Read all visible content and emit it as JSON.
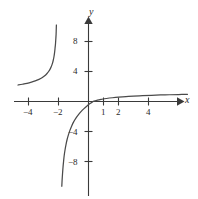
{
  "chart_data": {
    "type": "line",
    "title": "",
    "subtitle": "",
    "xlabel": "x",
    "ylabel": "y",
    "xlim": [
      -5.1,
      7.3
    ],
    "ylim": [
      -6.5,
      3.4
    ],
    "grid": false,
    "legend": null,
    "axis_color": "#3a3a3a",
    "curve_color": "#4a4a4a",
    "background": "#ffffff",
    "xticks": [
      -4,
      -2,
      1,
      2,
      4
    ],
    "xtick_labels": [
      "−4",
      "−2",
      "1",
      "2",
      "4"
    ],
    "yticks": [
      8,
      4,
      -4,
      -8
    ],
    "ytick_labels": [
      "8",
      "4",
      "−4",
      "−8"
    ],
    "series": [
      {
        "name": "upper-left-branch",
        "points": [
          [
            -4.7,
            2.2
          ],
          [
            -4.4,
            2.3
          ],
          [
            -4.1,
            2.42
          ],
          [
            -3.8,
            2.58
          ],
          [
            -3.55,
            2.74
          ],
          [
            -3.3,
            2.95
          ],
          [
            -3.1,
            3.16
          ],
          [
            -2.92,
            3.42
          ],
          [
            -2.78,
            3.7
          ],
          [
            -2.66,
            4.0
          ],
          [
            -2.56,
            4.32
          ],
          [
            -2.48,
            4.66
          ],
          [
            -2.41,
            5.05
          ],
          [
            -2.35,
            5.5
          ],
          [
            -2.3,
            6.0
          ],
          [
            -2.26,
            6.55
          ],
          [
            -2.23,
            7.1
          ],
          [
            -2.2,
            7.7
          ],
          [
            -2.18,
            8.3
          ],
          [
            -2.16,
            8.95
          ],
          [
            -2.15,
            9.6
          ],
          [
            -2.14,
            10.2
          ]
        ]
      },
      {
        "name": "lower-left-branch",
        "points": [
          [
            0.3,
            0.0
          ],
          [
            0.1,
            -0.28
          ],
          [
            -0.1,
            -0.6
          ],
          [
            -0.3,
            -0.95
          ],
          [
            -0.5,
            -1.35
          ],
          [
            -0.68,
            -1.78
          ],
          [
            -0.85,
            -2.25
          ],
          [
            -1.0,
            -2.75
          ],
          [
            -1.12,
            -3.25
          ],
          [
            -1.24,
            -3.85
          ],
          [
            -1.34,
            -4.45
          ],
          [
            -1.43,
            -5.1
          ],
          [
            -1.5,
            -5.75
          ],
          [
            -1.56,
            -6.4
          ],
          [
            -1.62,
            -7.2
          ],
          [
            -1.66,
            -7.95
          ],
          [
            -1.7,
            -8.8
          ],
          [
            -1.73,
            -9.6
          ],
          [
            -1.76,
            -10.5
          ],
          [
            -1.78,
            -11.3
          ]
        ]
      },
      {
        "name": "right-branch",
        "points": [
          [
            0.3,
            0.0
          ],
          [
            0.6,
            0.18
          ],
          [
            0.9,
            0.3
          ],
          [
            1.2,
            0.4
          ],
          [
            1.6,
            0.5
          ],
          [
            2.0,
            0.58
          ],
          [
            2.5,
            0.66
          ],
          [
            3.0,
            0.72
          ],
          [
            3.6,
            0.78
          ],
          [
            4.2,
            0.83
          ],
          [
            4.8,
            0.87
          ],
          [
            5.4,
            0.9
          ],
          [
            6.0,
            0.93
          ],
          [
            6.6,
            0.95
          ]
        ]
      }
    ]
  },
  "axes": {
    "x_axis_label": "x",
    "y_axis_label": "y"
  },
  "ticks": {
    "x": [
      {
        "label": "−4",
        "left": 23,
        "top": 108
      },
      {
        "label": "−2",
        "left": 53,
        "top": 108
      },
      {
        "label": "1",
        "left": 101,
        "top": 108
      },
      {
        "label": "2",
        "left": 116,
        "top": 108
      },
      {
        "label": "4",
        "left": 146,
        "top": 108
      }
    ],
    "y": [
      {
        "label": "8",
        "left": 73,
        "top": 37
      },
      {
        "label": "4",
        "left": 73,
        "top": 67
      },
      {
        "label": "−4",
        "left": 68,
        "top": 128
      },
      {
        "label": "−8",
        "left": 68,
        "top": 158
      }
    ]
  },
  "labels": {
    "x_pos": {
      "left": 185,
      "top": 95
    },
    "y_pos": {
      "left": 89,
      "top": 7
    }
  }
}
